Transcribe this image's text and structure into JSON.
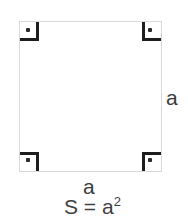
{
  "diagram": {
    "shape": "square",
    "stroke_color": "#d8d8d8",
    "marker_color": "#1d1d1d",
    "text_color": "#3b3b3b",
    "background_color": "#ffffff",
    "labels": {
      "side_right": "a",
      "side_bottom": "a",
      "formula_base": "S = a",
      "formula_exponent": "2",
      "formula_full": "S = a²"
    },
    "right_angle_markers": [
      {
        "position": "top-left",
        "symbol": "right-angle-dot"
      },
      {
        "position": "top-right",
        "symbol": "right-angle-dot"
      },
      {
        "position": "bottom-left",
        "symbol": "right-angle-dot"
      },
      {
        "position": "bottom-right",
        "symbol": "right-angle-dot"
      }
    ]
  }
}
